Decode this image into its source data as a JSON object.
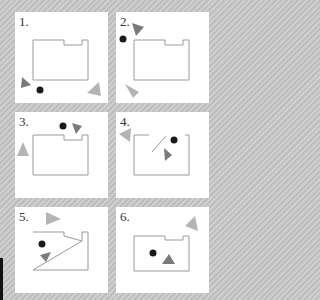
{
  "figure": {
    "colors": {
      "background_stripe_light": "#cfcfcf",
      "background_stripe_dark": "#bdbdbd",
      "panel": "#ffffff",
      "room_outline": "#9a9a9a",
      "dot": "#1a1a1a",
      "dark_triangle": "#7a7a7a",
      "light_triangle": "#b4b4b4"
    },
    "panels": [
      {
        "label": "1.",
        "x": 15,
        "y": 12,
        "w": 93,
        "h": 91
      },
      {
        "label": "2.",
        "x": 116,
        "y": 12,
        "w": 93,
        "h": 91
      },
      {
        "label": "3.",
        "x": 15,
        "y": 112,
        "w": 93,
        "h": 86
      },
      {
        "label": "4.",
        "x": 116,
        "y": 112,
        "w": 93,
        "h": 86
      },
      {
        "label": "5.",
        "x": 15,
        "y": 207,
        "w": 93,
        "h": 86
      },
      {
        "label": "6.",
        "x": 116,
        "y": 207,
        "w": 93,
        "h": 86
      }
    ]
  }
}
